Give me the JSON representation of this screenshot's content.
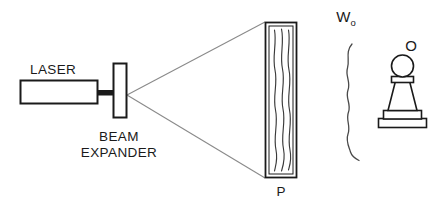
{
  "figure": {
    "kind": "optical-holography-setup-diagram",
    "background_color": "#ffffff",
    "line_color": "#1a1a1a",
    "beam_color": "#8a8a8a",
    "wave_color": "#3a3a3a",
    "width_px": 439,
    "height_px": 203
  },
  "labels": {
    "laser": "LASER",
    "beam_expander_line1": "BEAM",
    "beam_expander_line2": "EXPANDER",
    "plate": "P",
    "object_wave_symbol": "W",
    "object_wave_subscript": "o",
    "object": "O"
  },
  "components": [
    {
      "name": "laser-body",
      "label": "LASER",
      "shape": "rectangle",
      "x": 20,
      "y": 80,
      "width": 78,
      "height": 24
    },
    {
      "name": "laser-output-stem",
      "label": "",
      "shape": "thick-line",
      "x": 98,
      "y": 92,
      "width": 20,
      "height": 5
    },
    {
      "name": "beam-expander",
      "label": "BEAM EXPANDER",
      "shape": "rectangle",
      "x": 113,
      "y": 63,
      "width": 14,
      "height": 55
    },
    {
      "name": "holographic-plate",
      "label": "P",
      "shape": "rectangle",
      "x": 265,
      "y": 22,
      "width": 32,
      "height": 156
    },
    {
      "name": "object-pawn",
      "label": "O",
      "shape": "chess-pawn",
      "x": 378,
      "y": 58,
      "width": 50,
      "height": 68
    },
    {
      "name": "object-wavefront",
      "label": "Wo",
      "shape": "wavy-line",
      "x": 344,
      "y": 44,
      "width": 16,
      "height": 116
    }
  ],
  "beam_cone": {
    "name": "expanded-beam-cone",
    "apex_x": 127,
    "apex_y": 95,
    "top_x": 265,
    "top_y": 22,
    "bottom_x": 265,
    "bottom_y": 178
  },
  "plate_fringes": {
    "name": "interference-fringes",
    "count": 3,
    "orientation": "vertical-wavy"
  }
}
